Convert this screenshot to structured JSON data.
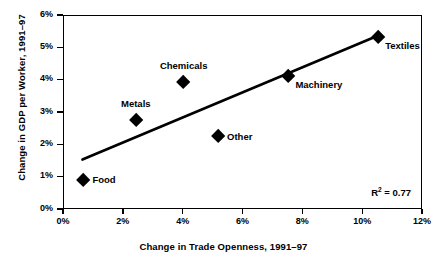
{
  "chart_data": {
    "type": "scatter",
    "title": "",
    "xlabel": "Change in Trade Openness, 1991–97",
    "ylabel": "Change in GDP per Worker, 1991–97",
    "xlim": [
      0,
      12
    ],
    "ylim": [
      0,
      6
    ],
    "xtick_labels": [
      "0%",
      "2%",
      "4%",
      "6%",
      "8%",
      "10%",
      "12%"
    ],
    "xtick_values": [
      0,
      2,
      4,
      6,
      8,
      10,
      12
    ],
    "ytick_labels": [
      "0%",
      "1%",
      "2%",
      "3%",
      "4%",
      "5%",
      "6%"
    ],
    "ytick_values": [
      0,
      1,
      2,
      3,
      4,
      5,
      6
    ],
    "grid": false,
    "legend": "none",
    "points": [
      {
        "label": "Food",
        "x": 0.65,
        "y": 0.92,
        "label_pos": "right"
      },
      {
        "label": "Metals",
        "x": 2.4,
        "y": 2.78,
        "label_pos": "above"
      },
      {
        "label": "Chemicals",
        "x": 4.0,
        "y": 3.95,
        "label_pos": "above"
      },
      {
        "label": "Other",
        "x": 5.15,
        "y": 2.27,
        "label_pos": "right"
      },
      {
        "label": "Machinery",
        "x": 7.5,
        "y": 4.15,
        "label_pos": "br"
      },
      {
        "label": "Textiles",
        "x": 10.5,
        "y": 5.35,
        "label_pos": "br"
      }
    ],
    "trendline": {
      "x0": 0.65,
      "y0": 1.53,
      "x1": 10.5,
      "y1": 5.35
    },
    "annotations": [
      {
        "name": "r-squared",
        "text_prefix": "R",
        "text_sup": "2",
        "text_suffix": " = 0.77",
        "value": 0.77
      }
    ],
    "colors": {
      "marker": "#000000",
      "line": "#000000",
      "axis": "#000000",
      "background": "#ffffff"
    }
  }
}
